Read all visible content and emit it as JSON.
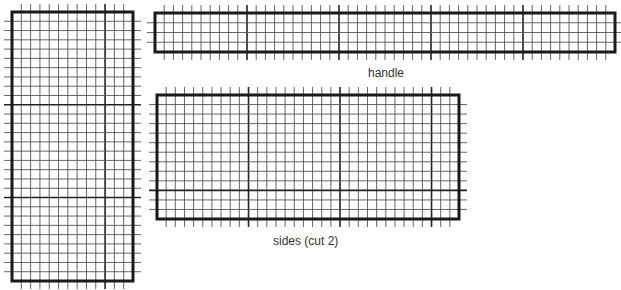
{
  "diagram": {
    "grid": {
      "cell_px": 9.2,
      "major_every": 10,
      "minor_color": "#555555",
      "major_color": "#222222",
      "border_color": "#1a1a1a",
      "tick_len": 8
    },
    "pieces": [
      {
        "id": "base",
        "label": "",
        "x": 12,
        "y": 12,
        "w": 121,
        "h": 269,
        "cols": 13,
        "rows": 29
      },
      {
        "id": "handle",
        "label": "handle",
        "x": 155,
        "y": 13,
        "w": 460,
        "h": 39,
        "cols": 50,
        "rows": 4
      },
      {
        "id": "sides",
        "label": "sides (cut 2)",
        "x": 157,
        "y": 95,
        "w": 302,
        "h": 124,
        "cols": 33,
        "rows": 13
      }
    ],
    "labels": {
      "handle": "handle",
      "sides": "sides (cut 2)"
    }
  }
}
